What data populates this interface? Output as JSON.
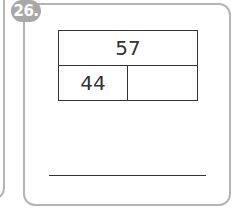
{
  "problem": {
    "number_badge": "26.",
    "number_bond": {
      "whole": "57",
      "part_a": "44",
      "part_b": ""
    },
    "answer_line_value": ""
  },
  "colors": {
    "badge_bg": "#a8a8a8",
    "card_border": "#b5b5b5",
    "line": "#333333"
  }
}
